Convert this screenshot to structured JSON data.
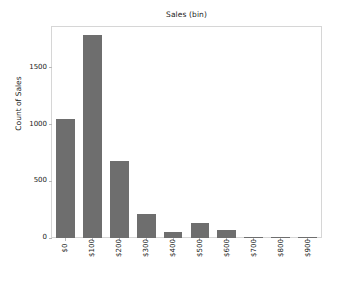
{
  "chart_data": {
    "type": "bar",
    "title": "Sales (bin)",
    "xlabel": "",
    "ylabel": "Count of Sales",
    "categories": [
      "$0",
      "$100",
      "$200",
      "$300",
      "$400",
      "$500",
      "$600",
      "$700",
      "$800",
      "$900"
    ],
    "values": [
      1050,
      1790,
      675,
      215,
      50,
      130,
      70,
      12,
      2,
      1
    ],
    "ylim": [
      0,
      1860
    ],
    "yticks": [
      0,
      500,
      1000,
      1500
    ],
    "ytick_labels": [
      "0",
      "500",
      "1000",
      "1500"
    ],
    "xtick_rotation": -90,
    "grid": false,
    "legend": null,
    "bar_color": "#6e6e6e",
    "frame_color": "#d6d6d6",
    "background_color": "#ffffff",
    "text_color": "#1a1a1a"
  }
}
